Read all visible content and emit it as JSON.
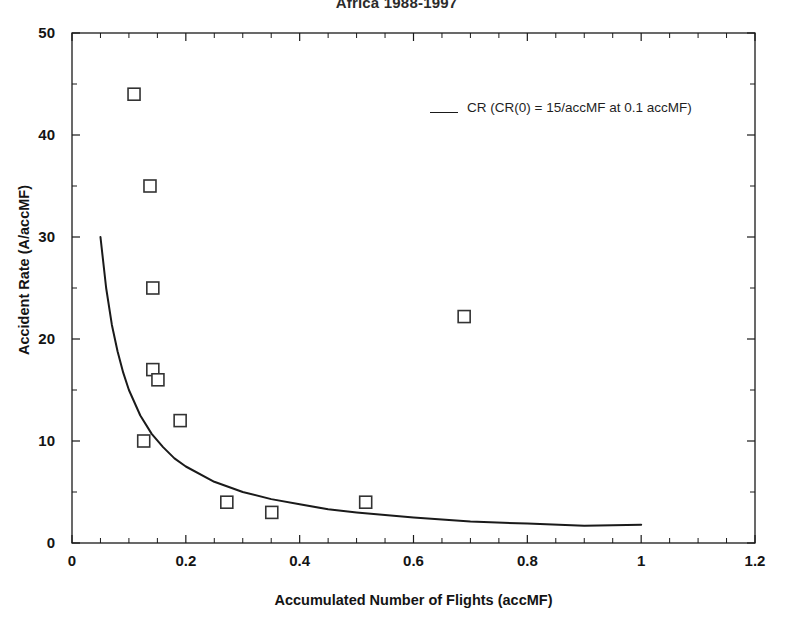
{
  "chart_data": {
    "type": "scatter",
    "title": "Africa 1988-1997",
    "xlabel": "Accumulated Number of Flights (accMF)",
    "ylabel": "Accident Rate (A/accMF)",
    "xlim": [
      0,
      1.2
    ],
    "ylim": [
      0,
      50
    ],
    "xticks": [
      "0",
      "0.2",
      "0.4",
      "0.6",
      "0.8",
      "1",
      "1.2"
    ],
    "xtick_values": [
      0,
      0.2,
      0.4,
      0.6,
      0.8,
      1,
      1.2
    ],
    "yticks": [
      "0",
      "10",
      "20",
      "30",
      "40",
      "50"
    ],
    "ytick_values": [
      0,
      10,
      20,
      30,
      40,
      50
    ],
    "grid": false,
    "legend_position": "inside-upper-right",
    "series": [
      {
        "name": "Accident data points",
        "marker": "open-square",
        "color": "#333333",
        "points": [
          {
            "x": 0.109,
            "y": 44
          },
          {
            "x": 0.137,
            "y": 35
          },
          {
            "x": 0.142,
            "y": 25
          },
          {
            "x": 0.142,
            "y": 17
          },
          {
            "x": 0.151,
            "y": 16
          },
          {
            "x": 0.126,
            "y": 10
          },
          {
            "x": 0.19,
            "y": 12
          },
          {
            "x": 0.272,
            "y": 4
          },
          {
            "x": 0.351,
            "y": 3
          },
          {
            "x": 0.516,
            "y": 4
          },
          {
            "x": 0.689,
            "y": 22.2
          }
        ]
      },
      {
        "name": "CR",
        "label": "CR (CR(0) = 15/accMF at 0.1 accMF)",
        "type": "line",
        "color": "#1a1a1a",
        "formula": "CR(x) = 1.5 / x",
        "x_range": [
          0.05,
          1.0
        ],
        "points": [
          {
            "x": 0.05,
            "y": 30.0
          },
          {
            "x": 0.06,
            "y": 25.0
          },
          {
            "x": 0.07,
            "y": 21.4
          },
          {
            "x": 0.08,
            "y": 18.8
          },
          {
            "x": 0.09,
            "y": 16.7
          },
          {
            "x": 0.1,
            "y": 15.0
          },
          {
            "x": 0.12,
            "y": 12.5
          },
          {
            "x": 0.14,
            "y": 10.7
          },
          {
            "x": 0.16,
            "y": 9.4
          },
          {
            "x": 0.18,
            "y": 8.3
          },
          {
            "x": 0.2,
            "y": 7.5
          },
          {
            "x": 0.25,
            "y": 6.0
          },
          {
            "x": 0.3,
            "y": 5.0
          },
          {
            "x": 0.35,
            "y": 4.3
          },
          {
            "x": 0.4,
            "y": 3.8
          },
          {
            "x": 0.45,
            "y": 3.3
          },
          {
            "x": 0.5,
            "y": 3.0
          },
          {
            "x": 0.6,
            "y": 2.5
          },
          {
            "x": 0.7,
            "y": 2.1
          },
          {
            "x": 0.8,
            "y": 1.9
          },
          {
            "x": 0.9,
            "y": 1.7
          },
          {
            "x": 1.0,
            "y": 1.8
          }
        ]
      }
    ]
  },
  "legend": {
    "entry": "CR (CR(0) = 15/accMF at 0.1 accMF)"
  }
}
